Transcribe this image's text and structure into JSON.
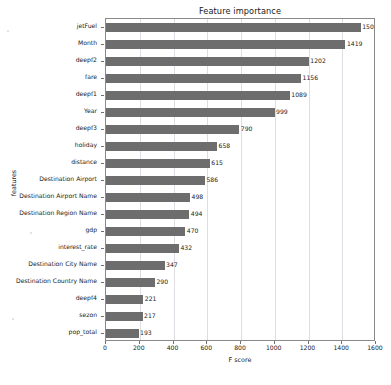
{
  "chart_data": {
    "type": "bar",
    "orientation": "horizontal",
    "title": "Feature importance",
    "xlabel": "F score",
    "ylabel": "features",
    "xlim": [
      0,
      1600
    ],
    "xticks": [
      0,
      200,
      400,
      600,
      800,
      1000,
      1200,
      1400,
      1600
    ],
    "grid": true,
    "legend": false,
    "bar_color": "#6d6d6d",
    "categories": [
      "jetFuel",
      "Month",
      "deepf2",
      "fare",
      "deepf1",
      "Year",
      "deepf3",
      "holiday",
      "distance",
      "Destination Airport",
      "Destination Airport Name",
      "Destination Region Name",
      "gdp",
      "interest_rate",
      "Destination City Name",
      "Destination Country Name",
      "deepf4",
      "sezon",
      "pop_total"
    ],
    "values": [
      1509,
      1419,
      1202,
      1156,
      1089,
      999,
      790,
      658,
      615,
      586,
      498,
      494,
      470,
      432,
      347,
      290,
      221,
      217,
      193
    ]
  }
}
